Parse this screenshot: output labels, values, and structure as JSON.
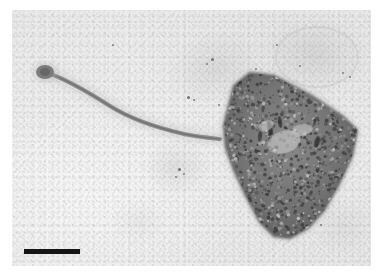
{
  "figure": {
    "type": "electron-micrograph",
    "modality": "transmission electron microscopy",
    "caption": "",
    "background_color": "#efefef",
    "page_color": "#ffffff",
    "plate": {
      "x": 12,
      "y": 10,
      "width": 359,
      "height": 256
    }
  },
  "scale_bar": {
    "label": "",
    "color": "#151515",
    "x": 24,
    "y": 249,
    "length_px": 56,
    "thickness_px": 5
  },
  "specimen": {
    "name": "flagellated cell",
    "body": {
      "name": "cell-body",
      "shape": "fan-shaped / triangular",
      "fill_color": "#6f6f6f",
      "edge_color": "#4a4a4a",
      "outline_points": "212,115 222,76 238,63 262,66 300,86 330,106 345,120 340,146 326,176 312,200 296,218 278,228 262,226 248,212 234,186 222,160 214,138",
      "granularity": "dense dark granules with bright internal patches"
    },
    "tail": {
      "name": "flagellum",
      "color": "#8d8d8d",
      "path": "M 33,62 C 52,68 76,82 98,96 C 120,110 146,118 172,124 C 186,127 198,128 208,129",
      "width_px": 4
    },
    "knob": {
      "name": "terminal-knob",
      "cx": 33,
      "cy": 62,
      "rx": 9,
      "ry": 7,
      "color": "#7b7b7b"
    },
    "internal_features": [
      {
        "name": "dark-slit-1",
        "cx": 258,
        "cy": 118,
        "w": 5,
        "h": 14,
        "color": "#2f2f2f",
        "rot": -12
      },
      {
        "name": "dark-slit-2",
        "cx": 268,
        "cy": 112,
        "w": 4,
        "h": 12,
        "color": "#343434",
        "rot": -8
      },
      {
        "name": "dark-slit-3",
        "cx": 248,
        "cy": 126,
        "w": 4,
        "h": 11,
        "color": "#3a3a3a",
        "rot": 8
      },
      {
        "name": "dark-slit-4",
        "cx": 305,
        "cy": 132,
        "w": 5,
        "h": 12,
        "color": "#303030",
        "rot": 14
      },
      {
        "name": "bright-patch-1",
        "cx": 272,
        "cy": 132,
        "w": 34,
        "h": 22,
        "color": "#cfcfcf",
        "rot": -18
      },
      {
        "name": "bright-patch-2",
        "cx": 254,
        "cy": 116,
        "w": 16,
        "h": 10,
        "color": "#d4d4d4",
        "rot": -22
      },
      {
        "name": "bright-patch-3",
        "cx": 290,
        "cy": 120,
        "w": 22,
        "h": 12,
        "color": "#c6c6c6",
        "rot": -10
      }
    ],
    "debris": [
      {
        "name": "debris-speck",
        "x": 199,
        "y": 48,
        "size": 3
      },
      {
        "name": "debris-speck",
        "x": 194,
        "y": 53,
        "size": 2
      },
      {
        "name": "debris-speck",
        "x": 175,
        "y": 86,
        "size": 3
      },
      {
        "name": "debris-speck",
        "x": 181,
        "y": 89,
        "size": 2
      },
      {
        "name": "debris-speck",
        "x": 166,
        "y": 158,
        "size": 3
      },
      {
        "name": "debris-speck",
        "x": 171,
        "y": 163,
        "size": 2
      },
      {
        "name": "debris-speck",
        "x": 163,
        "y": 166,
        "size": 2
      },
      {
        "name": "debris-speck",
        "x": 287,
        "y": 55,
        "size": 2
      },
      {
        "name": "debris-speck",
        "x": 330,
        "y": 62,
        "size": 2
      },
      {
        "name": "debris-speck",
        "x": 337,
        "y": 66,
        "size": 2
      },
      {
        "name": "debris-speck",
        "x": 206,
        "y": 94,
        "size": 2
      },
      {
        "name": "debris-speck",
        "x": 100,
        "y": 34,
        "size": 2
      },
      {
        "name": "debris-speck",
        "x": 264,
        "y": 34,
        "size": 2
      },
      {
        "name": "debris-speck",
        "x": 308,
        "y": 214,
        "size": 2
      },
      {
        "name": "debris-speck",
        "x": 243,
        "y": 58,
        "size": 2
      }
    ]
  }
}
